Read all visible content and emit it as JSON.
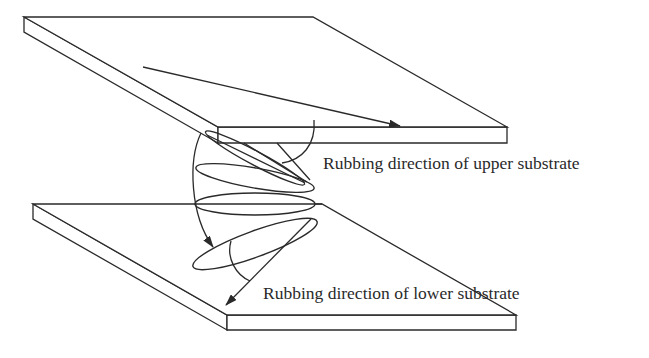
{
  "figure": {
    "type": "twisted-nematic liquid crystal cell schematic",
    "components": [
      {
        "name": "upper-substrate",
        "description": "upper glass plate with rubbing direction arrow"
      },
      {
        "name": "lower-substrate",
        "description": "lower glass plate with rubbing direction arrow"
      },
      {
        "name": "lc-molecules",
        "description": "stack of ellipsoidal liquid crystal molecules twisting between substrates"
      },
      {
        "name": "twist-arrow",
        "description": "curved arrow indicating twist of director"
      }
    ],
    "labels": {
      "upper": "Rubbing direction of upper substrate",
      "lower": "Rubbing direction of lower substrate"
    },
    "colors": {
      "line": "#2a2a2a",
      "background": "#ffffff"
    }
  }
}
